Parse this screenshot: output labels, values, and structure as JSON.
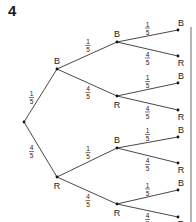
{
  "question_number": "4",
  "tree": {
    "root": {
      "x": 24,
      "y": 122
    },
    "level1": [
      {
        "label": "B",
        "prob_num": "1",
        "prob_den": "5",
        "x": 57,
        "y": 69
      },
      {
        "label": "R",
        "prob_num": "4",
        "prob_den": "5",
        "x": 57,
        "y": 177
      }
    ],
    "level2": [
      {
        "label": "B",
        "prob_num": "1",
        "prob_den": "5",
        "x": 117,
        "y": 42
      },
      {
        "label": "R",
        "prob_num": "4",
        "prob_den": "5",
        "x": 117,
        "y": 96
      },
      {
        "label": "B",
        "prob_num": "1",
        "prob_den": "5",
        "x": 117,
        "y": 148
      },
      {
        "label": "R",
        "prob_num": "4",
        "prob_den": "5",
        "x": 117,
        "y": 204
      }
    ],
    "level3": [
      {
        "label": "B",
        "prob_num": "1",
        "prob_den": "5",
        "x": 178,
        "y": 30
      },
      {
        "label": "R",
        "prob_num": "4",
        "prob_den": "5",
        "x": 178,
        "y": 56
      },
      {
        "label": "B",
        "prob_num": "1",
        "prob_den": "5",
        "x": 178,
        "y": 83
      },
      {
        "label": "R",
        "prob_num": "4",
        "prob_den": "5",
        "x": 178,
        "y": 110
      },
      {
        "label": "B",
        "prob_num": "1",
        "prob_den": "5",
        "x": 178,
        "y": 137
      },
      {
        "label": "R",
        "prob_num": "4",
        "prob_den": "5",
        "x": 178,
        "y": 163
      },
      {
        "label": "B",
        "prob_num": "1",
        "prob_den": "5",
        "x": 178,
        "y": 190
      },
      {
        "label": "R",
        "prob_num": "4",
        "prob_den": "5",
        "x": 178,
        "y": 217
      }
    ]
  }
}
